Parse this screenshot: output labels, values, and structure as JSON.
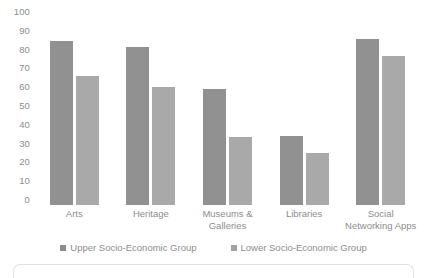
{
  "chart_data": {
    "type": "bar",
    "title": "",
    "xlabel": "",
    "ylabel": "",
    "ylim": [
      0,
      100
    ],
    "yticks": [
      100,
      90,
      80,
      70,
      60,
      50,
      40,
      30,
      20,
      10,
      0
    ],
    "grid": false,
    "legend_position": "bottom-center",
    "categories": [
      "Arts",
      "Heritage",
      "Museums & Galleries",
      "Libraries",
      "Social Networking Apps"
    ],
    "category_lines": [
      [
        "Arts"
      ],
      [
        "Heritage"
      ],
      [
        "Museums &",
        "Galleries"
      ],
      [
        "Libraries"
      ],
      [
        "Social",
        "Networking Apps"
      ]
    ],
    "series": [
      {
        "name": "Upper Socio-Economic Group",
        "color": "#919191",
        "values": [
          85,
          82,
          60,
          36,
          86
        ]
      },
      {
        "name": "Lower Socio-Economic Group",
        "color": "#a9a9a9",
        "values": [
          67,
          61,
          35,
          27,
          77
        ]
      }
    ]
  },
  "axis": {
    "y_tick_labels": [
      "100",
      "90",
      "80",
      "70",
      "60",
      "50",
      "40",
      "30",
      "20",
      "10",
      "0"
    ]
  },
  "legend": {
    "entries": [
      {
        "label": "Upper Socio-Economic Group",
        "swatch_color": "#8c8c8c"
      },
      {
        "label": "Lower Socio-Economic Group",
        "swatch_color": "#9f9f9f"
      }
    ]
  }
}
